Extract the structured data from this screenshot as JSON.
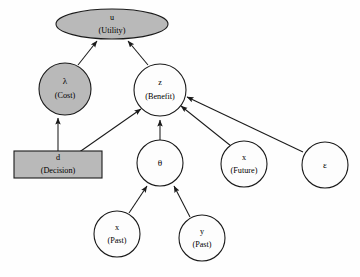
{
  "diagram": {
    "type": "influence-diagram",
    "background_color": "#ffffff",
    "shaded_color": "#b9b9b9",
    "unshaded_color": "#fdfdfd",
    "stroke_color": "#1a1a1a",
    "nodes": [
      {
        "id": "u",
        "shape": "ellipse",
        "shaded": true,
        "symbol": "u",
        "qualifier": "(Utility)",
        "cx": 112,
        "cy": 24,
        "rx": 56,
        "ry": 15
      },
      {
        "id": "lambda",
        "shape": "circle",
        "shaded": true,
        "symbol": "λ",
        "qualifier": "(Cost)",
        "cx": 65,
        "cy": 89,
        "r": 26
      },
      {
        "id": "z",
        "shape": "circle",
        "shaded": false,
        "symbol": "z",
        "qualifier": "(Benefit)",
        "cx": 160,
        "cy": 90,
        "r": 26
      },
      {
        "id": "d",
        "shape": "rect",
        "shaded": true,
        "symbol": "d",
        "qualifier": "(Decision)",
        "x": 14,
        "y": 151,
        "width": 88,
        "height": 27
      },
      {
        "id": "theta",
        "shape": "circle",
        "shaded": false,
        "symbol": "θ",
        "qualifier": "",
        "cx": 160,
        "cy": 163,
        "r": 23
      },
      {
        "id": "x_future",
        "shape": "circle",
        "shaded": false,
        "symbol": "x",
        "qualifier": "(Future)",
        "cx": 244,
        "cy": 164,
        "r": 23
      },
      {
        "id": "epsilon",
        "shape": "circle",
        "shaded": false,
        "symbol": "ε",
        "qualifier": "",
        "cx": 325,
        "cy": 165,
        "r": 23
      },
      {
        "id": "x_past",
        "shape": "circle",
        "shaded": false,
        "symbol": "x",
        "qualifier": "(Past)",
        "cx": 117,
        "cy": 234,
        "r": 23
      },
      {
        "id": "y_past",
        "shape": "circle",
        "shaded": false,
        "symbol": "y",
        "qualifier": "(Past)",
        "cx": 202,
        "cy": 238,
        "r": 23
      }
    ],
    "edges": [
      {
        "from": "lambda",
        "to": "u",
        "label": ""
      },
      {
        "from": "z",
        "to": "u",
        "label": ""
      },
      {
        "from": "d",
        "to": "lambda",
        "label": ""
      },
      {
        "from": "d",
        "to": "z",
        "label": ""
      },
      {
        "from": "theta",
        "to": "z",
        "label": ""
      },
      {
        "from": "x_future",
        "to": "z",
        "label": ""
      },
      {
        "from": "epsilon",
        "to": "z",
        "label": ""
      },
      {
        "from": "x_past",
        "to": "theta",
        "label": ""
      },
      {
        "from": "y_past",
        "to": "theta",
        "label": ""
      }
    ]
  }
}
